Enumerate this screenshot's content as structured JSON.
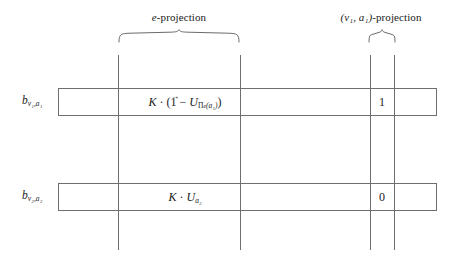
{
  "figure": {
    "type": "diagram",
    "background": "#ffffff",
    "line_color": "#6e6e6e",
    "text_color": "#1a1a1a"
  },
  "group_labels": [
    {
      "id": "e-projection",
      "prefix_italic": "e",
      "suffix": "-projection",
      "span_x": [
        118,
        240
      ]
    },
    {
      "id": "v1-a1-projection",
      "prefix_italic": "(v₁, a₁)",
      "suffix": "-projection",
      "span_x": [
        368,
        394
      ]
    }
  ],
  "rows": [
    {
      "id": "row-b-v1-a1",
      "label_base": "b",
      "label_sub": "v₁,a₁",
      "formula": {
        "k": "K",
        "dot": "·",
        "open": "(",
        "one_vector": "1",
        "minus": "−",
        "u": "U",
        "u_sub_pi": "Π",
        "u_sub_pi_sub": "e",
        "u_sub_arg": "(a₁)",
        "close": ")"
      },
      "formula_plain": "K · (1⃗ − U_{Π_e(a₁)})",
      "projection_value": "1"
    },
    {
      "id": "row-b-v2-a2",
      "label_base": "b",
      "label_sub": "v₂,a₂",
      "formula": {
        "k": "K",
        "dot": "·",
        "u": "U",
        "u_sub": "a₂"
      },
      "formula_plain": "K · U_{a₂}",
      "projection_value": "0"
    }
  ],
  "guides": {
    "vertical_lines_x": [
      118,
      240,
      370,
      394
    ],
    "vertical_span_y": [
      55,
      250
    ],
    "row_box_x": [
      58,
      437
    ],
    "row1_box_y": [
      88,
      115
    ],
    "row2_box_y": [
      183,
      210
    ],
    "row1_extra_rule": {
      "x": [
        97,
        437
      ],
      "y": 115
    }
  }
}
